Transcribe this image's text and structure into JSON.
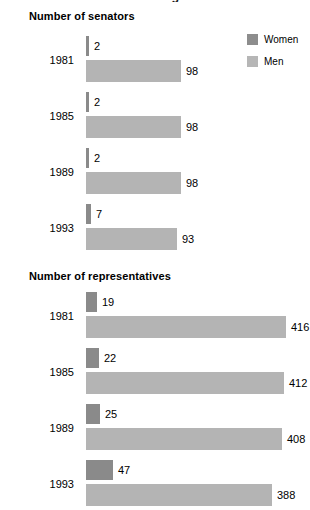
{
  "document": {
    "cut_off_title": "Women and Men in Congress"
  },
  "legend": {
    "position": "top-right",
    "items": [
      {
        "label": "Women",
        "color": "#8d8d8d",
        "swatch_name": "legend-swatch-women"
      },
      {
        "label": "Men",
        "color": "#b6b6b6",
        "swatch_name": "legend-swatch-men"
      }
    ]
  },
  "sections": [
    {
      "id": "senators",
      "heading": "Number of senators",
      "rows": [
        {
          "year": "1981",
          "women": "2",
          "men": "98",
          "women_px": 3,
          "men_px": 95
        },
        {
          "year": "1985",
          "women": "2",
          "men": "98",
          "women_px": 3,
          "men_px": 95
        },
        {
          "year": "1989",
          "women": "2",
          "men": "98",
          "women_px": 3,
          "men_px": 95
        },
        {
          "year": "1993",
          "women": "7",
          "men": "93",
          "women_px": 5,
          "men_px": 91
        }
      ]
    },
    {
      "id": "representatives",
      "heading": "Number of representatives",
      "rows": [
        {
          "year": "1981",
          "women": "19",
          "men": "416",
          "women_px": 11,
          "men_px": 200
        },
        {
          "year": "1985",
          "women": "22",
          "men": "412",
          "women_px": 13,
          "men_px": 198
        },
        {
          "year": "1989",
          "women": "25",
          "men": "408",
          "women_px": 14,
          "men_px": 196
        },
        {
          "year": "1993",
          "women": "47",
          "men": "388",
          "women_px": 27,
          "men_px": 186
        }
      ]
    }
  ],
  "chart_data": {
    "type": "bar",
    "title": "Women and Men in Congress",
    "orientation": "horizontal",
    "grid": false,
    "legend_position": "top-right",
    "panels": [
      {
        "title": "Number of senators",
        "xlabel": "",
        "ylabel": "",
        "categories": [
          "1981",
          "1985",
          "1989",
          "1993"
        ],
        "series": [
          {
            "name": "Women",
            "color": "#8d8d8d",
            "values": [
              2,
              2,
              2,
              7
            ]
          },
          {
            "name": "Men",
            "color": "#b6b6b6",
            "values": [
              98,
              98,
              98,
              93
            ]
          }
        ],
        "xlim": [
          0,
          100
        ],
        "data_labels": true
      },
      {
        "title": "Number of representatives",
        "xlabel": "",
        "ylabel": "",
        "categories": [
          "1981",
          "1985",
          "1989",
          "1993"
        ],
        "series": [
          {
            "name": "Women",
            "color": "#8d8d8d",
            "values": [
              19,
              22,
              25,
              47
            ]
          },
          {
            "name": "Men",
            "color": "#b6b6b6",
            "values": [
              416,
              412,
              408,
              388
            ]
          }
        ],
        "xlim": [
          0,
          435
        ],
        "data_labels": true
      }
    ]
  }
}
